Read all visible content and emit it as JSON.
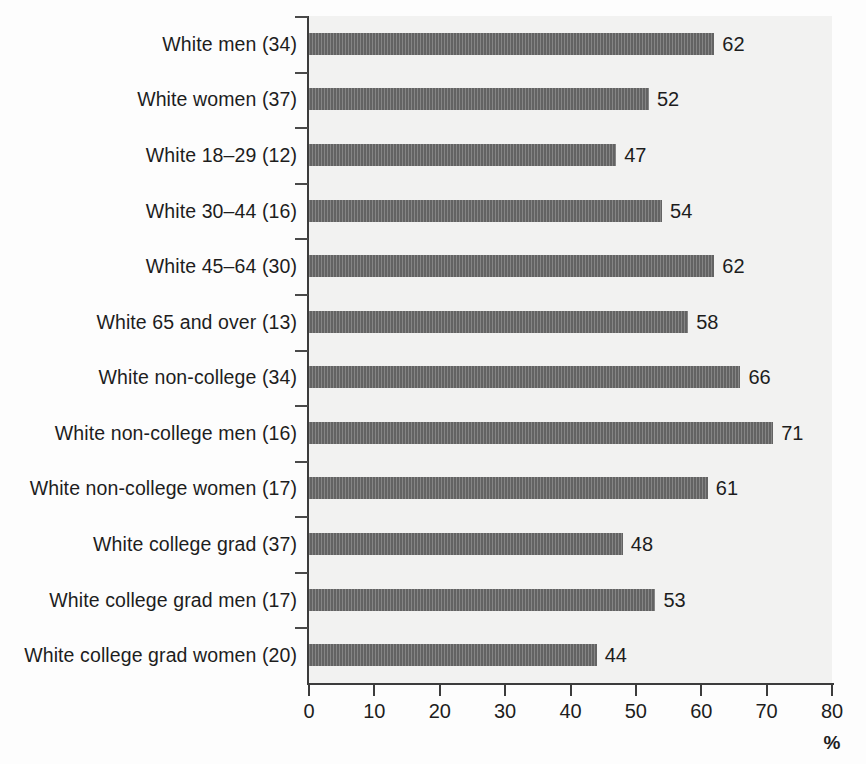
{
  "chart_data": {
    "type": "bar",
    "orientation": "horizontal",
    "title": "",
    "subtitle": "",
    "xlabel": "%",
    "ylabel": "",
    "xlim": [
      0,
      80
    ],
    "xticks": [
      0,
      10,
      20,
      30,
      40,
      50,
      60,
      70,
      80
    ],
    "xtick_labels": [
      "0",
      "10",
      "20",
      "30",
      "40",
      "50",
      "60",
      "70",
      "80"
    ],
    "grid": false,
    "legend": null,
    "categories": [
      "White men (34)",
      "White women (37)",
      "White 18–29 (12)",
      "White 30–44 (16)",
      "White 45–64 (30)",
      "White 65 and over (13)",
      "White non-college (34)",
      "White non-college men (16)",
      "White non-college women (17)",
      "White college grad (37)",
      "White college grad men (17)",
      "White college grad women (20)"
    ],
    "values": [
      62,
      52,
      47,
      54,
      62,
      58,
      66,
      71,
      61,
      48,
      53,
      44
    ],
    "value_labels": [
      "62",
      "52",
      "47",
      "54",
      "62",
      "58",
      "66",
      "71",
      "61",
      "48",
      "53",
      "44"
    ],
    "colors": {
      "bar": "#6e6e6e",
      "plot_background": "#f2f2f1",
      "page_background": "#fdfdfd",
      "axis": "#3c3c3c",
      "text": "#1d1d1d"
    }
  }
}
